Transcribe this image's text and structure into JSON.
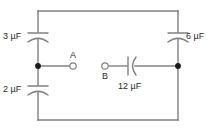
{
  "figure": {
    "type": "circuit-diagram",
    "title": "",
    "background_color": "#ffffff",
    "wire_color": "#808080",
    "text_color": "#2b2b2b",
    "node_color": "#1a1a1a"
  },
  "frame": {
    "left": 38,
    "top": 11,
    "right": 178,
    "bottom": 120
  },
  "components": [
    {
      "id": "c3",
      "kind": "capacitor",
      "symbol_style": "polarized",
      "orientation": "vertical",
      "value": "3",
      "unit": "µF",
      "label": "3 µF",
      "label_position": "left",
      "branch": "left-vertical",
      "x": 38,
      "y": 35
    },
    {
      "id": "c2",
      "kind": "capacitor",
      "symbol_style": "polarized",
      "orientation": "vertical",
      "value": "2",
      "unit": "µF",
      "label": "2 µF",
      "label_position": "left",
      "branch": "left-vertical",
      "x": 38,
      "y": 88
    },
    {
      "id": "c6",
      "kind": "capacitor",
      "symbol_style": "polarized",
      "orientation": "vertical",
      "value": "6",
      "unit": "µF",
      "label": "6 µF",
      "label_position": "right",
      "branch": "right-vertical",
      "x": 178,
      "y": 35
    },
    {
      "id": "c12",
      "kind": "capacitor",
      "symbol_style": "polarized",
      "orientation": "horizontal",
      "value": "12",
      "unit": "µF",
      "label": "12 µF",
      "label_position": "below",
      "branch": "middle-horizontal",
      "x": 130,
      "y": 66
    }
  ],
  "terminals": [
    {
      "id": "a",
      "label": "A",
      "style": "open-circle",
      "label_position": "above",
      "x": 73,
      "y": 66
    },
    {
      "id": "b",
      "label": "B",
      "style": "open-circle",
      "label_position": "below",
      "x": 105,
      "y": 66
    }
  ],
  "junctions": [
    {
      "id": "left-node",
      "style": "filled-dot",
      "x": 38,
      "y": 66
    },
    {
      "id": "right-node",
      "style": "filled-dot",
      "x": 178,
      "y": 66
    }
  ]
}
